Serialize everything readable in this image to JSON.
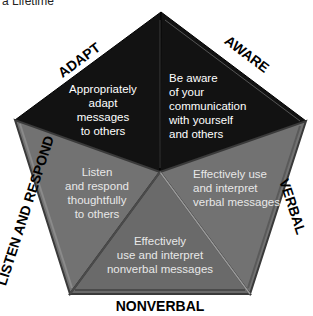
{
  "caption": "a Lifetime",
  "colors": {
    "dark_segment": "#111111",
    "gray_segment": "#6f6f6f",
    "gray_segment_edge": "#3c3c3c",
    "label_text": "#000000",
    "segment_text": "#ffffff"
  },
  "segments": [
    {
      "id": "adapt",
      "edge_label": "ADAPT",
      "lines": [
        "Appropriately",
        "adapt",
        "messages",
        "to others"
      ]
    },
    {
      "id": "aware",
      "edge_label": "AWARE",
      "lines": [
        "Be aware",
        "of your",
        "communication",
        "with yourself",
        "and others"
      ]
    },
    {
      "id": "verbal",
      "edge_label": "VERBAL",
      "lines": [
        "Effectively use",
        "and interpret",
        "verbal messages"
      ]
    },
    {
      "id": "nonverbal",
      "edge_label": "NONVERBAL",
      "lines": [
        "Effectively",
        "use and interpret",
        "nonverbal messages"
      ]
    },
    {
      "id": "listen",
      "edge_label": "LISTEN AND RESPOND",
      "lines": [
        "Listen",
        "and respond",
        "thoughtfully",
        "to others"
      ]
    }
  ]
}
